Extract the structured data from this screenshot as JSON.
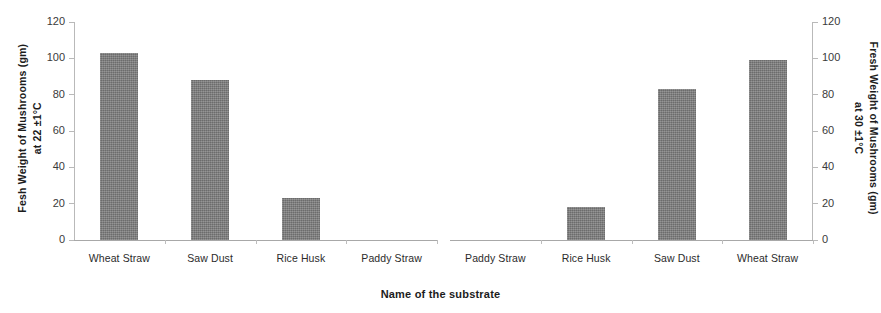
{
  "chart_data": {
    "type": "bar",
    "title": "",
    "xlabel": "Name of the substrate",
    "grid": false,
    "legend": false,
    "panels": [
      {
        "name": "left-panel",
        "ylabel_line1": "Fesh Weight of Mushrooms  (gm)",
        "ylabel_line2": "at 22 ±1°C",
        "ylim": [
          0,
          120
        ],
        "yticks": [
          0,
          20,
          40,
          60,
          80,
          100,
          120
        ],
        "ytick_labels": [
          "0",
          "20",
          "40",
          "60",
          "80",
          "100",
          "120"
        ],
        "axis_side": "left",
        "categories": [
          "Wheat Straw",
          "Saw Dust",
          "Rice Husk",
          "Paddy Straw"
        ],
        "values": [
          103,
          88,
          23,
          0
        ]
      },
      {
        "name": "right-panel",
        "ylabel_line1": "Fresh Weight of Mushrooms (gm)",
        "ylabel_line2": "at 30 ±1°C",
        "ylim": [
          0,
          120
        ],
        "yticks": [
          0,
          20,
          40,
          60,
          80,
          100,
          120
        ],
        "ytick_labels": [
          "0",
          "20",
          "40",
          "60",
          "80",
          "100",
          "120"
        ],
        "axis_side": "right",
        "categories": [
          "Paddy Straw",
          "Rice Husk",
          "Saw Dust",
          "Wheat Straw"
        ],
        "values": [
          0,
          18,
          83,
          99
        ]
      }
    ],
    "colors": {
      "bar": "#7b7b7b",
      "axis": "#b9b9b9",
      "text": "#2b2b2b"
    }
  }
}
